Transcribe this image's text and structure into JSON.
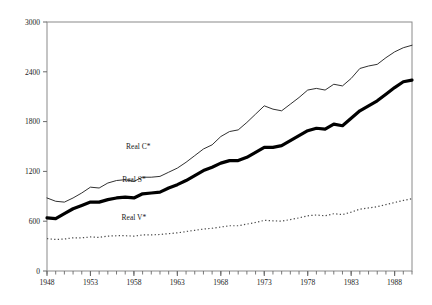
{
  "chart_data": {
    "type": "line",
    "title": "",
    "subtitle": "",
    "xlabel": "",
    "ylabel": "",
    "xlim": [
      1948,
      1990
    ],
    "ylim": [
      0,
      3000
    ],
    "grid": false,
    "legend_position": "inline-annotations",
    "yticks": [
      0,
      600,
      1200,
      1800,
      2400,
      3000
    ],
    "ytick_labels": [
      "0",
      "600",
      "1200",
      "1800",
      "2400",
      "3000"
    ],
    "xticks": [
      1948,
      1953,
      1958,
      1963,
      1968,
      1973,
      1978,
      1983,
      1988
    ],
    "xtick_labels": [
      "1948",
      "1953",
      "1958",
      "1963",
      "1968",
      "1973",
      "1978",
      "1983",
      "1988"
    ],
    "x_minor_tick_interval": 1,
    "x": [
      1948,
      1949,
      1950,
      1951,
      1952,
      1953,
      1954,
      1955,
      1956,
      1957,
      1958,
      1959,
      1960,
      1961,
      1962,
      1963,
      1964,
      1965,
      1966,
      1967,
      1968,
      1969,
      1970,
      1971,
      1972,
      1973,
      1974,
      1975,
      1976,
      1977,
      1978,
      1979,
      1980,
      1981,
      1982,
      1983,
      1984,
      1985,
      1986,
      1987,
      1988,
      1989,
      1990
    ],
    "series": [
      {
        "name": "Real C*",
        "style": "thin-solid",
        "color": "#1a1a1a",
        "linewidth": 0.9,
        "label_text": "Real C*",
        "label_x": 1958.5,
        "label_y": 1470,
        "values": [
          880,
          840,
          830,
          880,
          940,
          1010,
          1000,
          1060,
          1090,
          1100,
          1080,
          1130,
          1130,
          1140,
          1190,
          1240,
          1310,
          1390,
          1470,
          1520,
          1620,
          1680,
          1700,
          1790,
          1890,
          1990,
          1950,
          1930,
          2010,
          2090,
          2180,
          2200,
          2180,
          2250,
          2230,
          2320,
          2440,
          2470,
          2490,
          2570,
          2640,
          2690,
          2720
        ]
      },
      {
        "name": "Real S*",
        "style": "thick-solid",
        "color": "#000000",
        "linewidth": 3.2,
        "label_text": "Real S*",
        "label_x": 1958.0,
        "label_y": 1075,
        "values": [
          640,
          630,
          690,
          750,
          790,
          830,
          830,
          860,
          880,
          890,
          880,
          930,
          940,
          950,
          1000,
          1040,
          1090,
          1150,
          1210,
          1250,
          1300,
          1330,
          1330,
          1370,
          1430,
          1490,
          1490,
          1510,
          1570,
          1630,
          1690,
          1720,
          1710,
          1770,
          1750,
          1840,
          1930,
          1990,
          2050,
          2130,
          2210,
          2280,
          2300
        ]
      },
      {
        "name": "Real V*",
        "style": "dotted",
        "color": "#4a4a4a",
        "linewidth": 1.2,
        "label_text": "Real V*",
        "label_x": 1958.0,
        "label_y": 620,
        "values": [
          390,
          380,
          385,
          400,
          400,
          410,
          405,
          420,
          425,
          425,
          420,
          435,
          435,
          440,
          450,
          460,
          475,
          490,
          505,
          515,
          530,
          545,
          545,
          565,
          585,
          610,
          605,
          600,
          620,
          640,
          665,
          675,
          665,
          690,
          680,
          710,
          745,
          760,
          775,
          800,
          825,
          850,
          870
        ]
      }
    ]
  },
  "axes": {
    "frame_color": "#7a7a7a",
    "tick_color": "#6a6a6a"
  }
}
